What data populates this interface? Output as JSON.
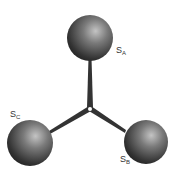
{
  "diagram": {
    "type": "molecule-star",
    "center": {
      "x": 90,
      "y": 109
    },
    "spheres": [
      {
        "id": "A",
        "label": "S",
        "subscript": "A",
        "cx": 90,
        "cy": 38,
        "r": 23
      },
      {
        "id": "B",
        "label": "S",
        "subscript": "B",
        "cx": 146,
        "cy": 142,
        "r": 22
      },
      {
        "id": "C",
        "label": "S",
        "subscript": "C",
        "cx": 30,
        "cy": 143,
        "r": 23
      }
    ],
    "colors": {
      "sphere_dark": "#2a2a2a",
      "sphere_light": "#b5b5b5",
      "bond": "#3a3a3a"
    }
  },
  "labels": {
    "a": {
      "main": "S",
      "sub": "A"
    },
    "b": {
      "main": "S",
      "sub": "B"
    },
    "c": {
      "main": "S",
      "sub": "C"
    }
  }
}
